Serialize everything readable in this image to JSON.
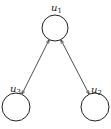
{
  "diagram": {
    "type": "directed-graph",
    "nodes": [
      {
        "id": "u1",
        "label": "u",
        "sub": "1",
        "cx": 55,
        "cy": 28,
        "r": 13,
        "lx": 52,
        "ly": 11
      },
      {
        "id": "u3",
        "label": "u",
        "sub": "3",
        "cx": 16,
        "cy": 107,
        "r": 14,
        "lx": 9,
        "ly": 92
      },
      {
        "id": "u2",
        "label": "u",
        "sub": "2",
        "cx": 95,
        "cy": 107,
        "r": 14,
        "lx": 90,
        "ly": 93
      }
    ],
    "edges": [
      {
        "from": "u1",
        "to": "u3",
        "bidirectional": true
      },
      {
        "from": "u1",
        "to": "u2",
        "bidirectional": true
      }
    ],
    "colors": {
      "stroke": "#222222",
      "background": "#ffffff"
    }
  }
}
